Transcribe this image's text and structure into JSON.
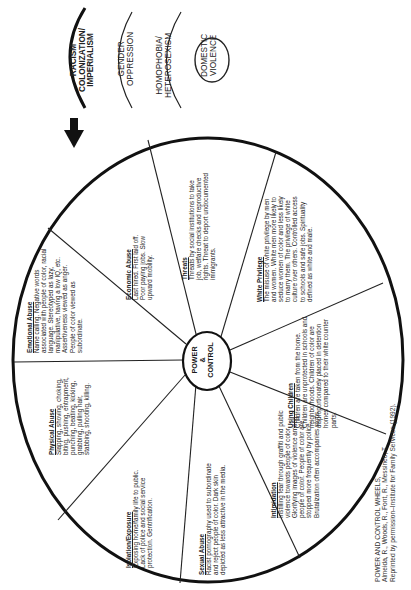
{
  "legend": {
    "layers": [
      {
        "lines": [
          "RACISM",
          "COLONIZATION/",
          "IMPERIALISM"
        ],
        "bold": true
      },
      {
        "lines": [
          "GENDER",
          "OPPRESSION"
        ],
        "bold": false
      },
      {
        "lines": [
          "HOMOPHOBIA/",
          "HETEROSEXISM"
        ],
        "bold": false
      },
      {
        "lines": [
          "DOMESTIC",
          "VIOLENCE"
        ],
        "bold": false
      }
    ]
  },
  "center": {
    "line1": "POWER",
    "line2": "&",
    "line3": "CONTROL"
  },
  "segments": [
    {
      "title": "Economic Abuse",
      "text": "Last hired. First laid off. Poor paying jobs. Slow upward mobility."
    },
    {
      "title": "Threats",
      "text": "Threats by social institutions to take job, welfare checks and reproductive rights. Threat to deport undocumented immigrants."
    },
    {
      "title": "White Privilege",
      "text": "The misuse of white privilege by men and women. White men more likely to seduce women of color and less likely to marry them. The privilege of white culture over others. Controlled access to schools and safe jobs. Spirituality defined as white and male."
    },
    {
      "title": "Using Children",
      "text": "Children are taken from the home. Children are unprotected in schools and neighborhoods. Children of color are disproportionately placed in detention homes compared to their white counter parts."
    },
    {
      "title": "Intimidation",
      "text": "Instilling fear through graffiti and public violence towards people of color. Glorifying images of violence among people of color. People of color are stopped more frequently by police. Brutalization often accompanies stops."
    },
    {
      "title": "Sexual Abuse",
      "text": "Racist pornography used to subordinate and reject people of color. Dark skin depicted as less attractive in the media."
    },
    {
      "title": "Isolation/Exposure",
      "text": "Exposing home/family life to public. Lack of police and social service protection. Gentrification."
    },
    {
      "title": "Physical Abuse",
      "text": "Slapping, shoving, choking, biting, pushing, entrapment, punching, beating, kicking, grabbing, pulling hair, stabbing, shooting, killing."
    },
    {
      "title": "Emotional Abuse",
      "text": "Name calling. Negative words associated with people of color, racial language. Stereotyped as lazy, manipulative, having a low IQ, etc. Assertiveness viewed as anger. People of color viewed as subordinate."
    }
  ],
  "citation": {
    "line1": "POWER AND CONTROL WHEELS,",
    "line2": "Almeida, R., Woods, R., Font, R., Messineo, T.",
    "line3": "Reprinted by permission–Institute for Family Services (1992)."
  },
  "arrow": {
    "icon": "down-arrow-icon"
  }
}
